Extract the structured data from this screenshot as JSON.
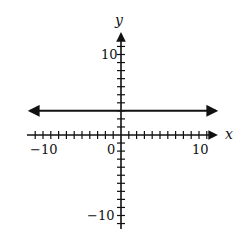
{
  "chart_data": {
    "type": "line",
    "title": "",
    "xlabel": "x",
    "ylabel": "y",
    "xlim": [
      -12,
      12
    ],
    "ylim": [
      -12,
      12
    ],
    "x_ticks": {
      "step": 1,
      "labels": [
        -10,
        0,
        10
      ]
    },
    "y_ticks": {
      "step": 1,
      "labels": [
        10,
        -10
      ]
    },
    "grid": false,
    "legend": null,
    "series": [
      {
        "name": "y = 3",
        "equation": "y = 3",
        "kind": "horizontal-line",
        "y": 3,
        "x": [
          -12,
          12
        ],
        "values": [
          3,
          3
        ],
        "arrows": "both"
      }
    ]
  },
  "labels": {
    "x_axis": "x",
    "y_axis": "y",
    "x_neg10": "−10",
    "x_zero": "0",
    "x_pos10": "10",
    "y_pos10": "10",
    "y_neg10": "−10"
  },
  "colors": {
    "ink": "#111111",
    "background": "#ffffff"
  }
}
